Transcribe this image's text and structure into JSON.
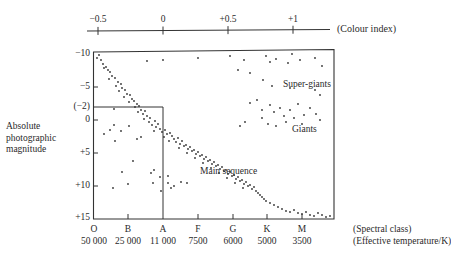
{
  "colour_axis": {
    "label": "(Colour index)",
    "ticks": [
      {
        "label": "−0.5",
        "x": 98
      },
      {
        "label": "0",
        "x": 163
      },
      {
        "label": "+0.5",
        "x": 228
      },
      {
        "label": "+1",
        "x": 293
      }
    ]
  },
  "y_axis": {
    "label_lines": [
      "Absolute",
      "photographic",
      "magnitude"
    ],
    "ticks": [
      {
        "label": "−10",
        "y": 54
      },
      {
        "label": "−5",
        "y": 87
      },
      {
        "label": "(−2)",
        "y": 107
      },
      {
        "label": "0",
        "y": 120
      },
      {
        "label": "+5",
        "y": 153
      },
      {
        "label": "+10",
        "y": 186
      },
      {
        "label": "+15",
        "y": 218
      }
    ]
  },
  "x_axis": {
    "spectral_label": "(Spectral class)",
    "temperature_label": "(Effective temperature/K)",
    "ticks": [
      {
        "class": "O",
        "temp": "50 000",
        "x": 94
      },
      {
        "class": "B",
        "temp": "25 000",
        "x": 128
      },
      {
        "class": "A",
        "temp": "11 000",
        "x": 163
      },
      {
        "class": "F",
        "temp": "7500",
        "x": 198
      },
      {
        "class": "G",
        "temp": "6000",
        "x": 233
      },
      {
        "class": "K",
        "temp": "5000",
        "x": 267
      },
      {
        "class": "M",
        "temp": "3500",
        "x": 302
      }
    ]
  },
  "annotations": {
    "super_giants": "Super-giants",
    "giants": "Giants",
    "main_sequence": "Main sequence"
  },
  "chart_data": {
    "type": "scatter",
    "xlabel": "Spectral class / Effective temperature (K) / Colour index",
    "ylabel": "Absolute photographic magnitude",
    "ylim": [
      -10,
      15
    ],
    "y_inverted": true,
    "x_categories": [
      "O",
      "B",
      "A",
      "F",
      "G",
      "K",
      "M"
    ],
    "x_temperatures": [
      "50 000",
      "25 000",
      "11 000",
      "7500",
      "6000",
      "5000",
      "3500"
    ],
    "colour_index_ticks": [
      -0.5,
      0,
      0.5,
      1
    ],
    "reference_lines": {
      "magnitude": -2,
      "spectral_class": "A"
    },
    "regions": [
      "Super-giants",
      "Giants",
      "Main sequence"
    ],
    "points_px": [
      [
        99,
        55
      ],
      [
        97,
        58
      ],
      [
        101,
        60
      ],
      [
        103,
        64
      ],
      [
        106,
        67
      ],
      [
        108,
        70
      ],
      [
        104,
        68
      ],
      [
        110,
        72
      ],
      [
        112,
        76
      ],
      [
        109,
        79
      ],
      [
        115,
        78
      ],
      [
        118,
        82
      ],
      [
        116,
        86
      ],
      [
        121,
        84
      ],
      [
        122,
        88
      ],
      [
        119,
        91
      ],
      [
        125,
        90
      ],
      [
        127,
        94
      ],
      [
        124,
        97
      ],
      [
        130,
        95
      ],
      [
        132,
        99
      ],
      [
        129,
        102
      ],
      [
        134,
        101
      ],
      [
        137,
        104
      ],
      [
        135,
        107
      ],
      [
        139,
        106
      ],
      [
        141,
        110
      ],
      [
        138,
        112
      ],
      [
        143,
        114
      ],
      [
        145,
        111
      ],
      [
        147,
        116
      ],
      [
        144,
        119
      ],
      [
        150,
        118
      ],
      [
        149,
        122
      ],
      [
        152,
        125
      ],
      [
        155,
        121
      ],
      [
        156,
        127
      ],
      [
        158,
        124
      ],
      [
        160,
        129
      ],
      [
        154,
        131
      ],
      [
        162,
        132
      ],
      [
        165,
        130
      ],
      [
        167,
        134
      ],
      [
        164,
        137
      ],
      [
        170,
        133
      ],
      [
        172,
        136
      ],
      [
        174,
        139
      ],
      [
        169,
        141
      ],
      [
        176,
        142
      ],
      [
        178,
        138
      ],
      [
        180,
        144
      ],
      [
        182,
        141
      ],
      [
        184,
        146
      ],
      [
        179,
        148
      ],
      [
        186,
        145
      ],
      [
        188,
        149
      ],
      [
        190,
        147
      ],
      [
        192,
        151
      ],
      [
        187,
        153
      ],
      [
        194,
        150
      ],
      [
        196,
        154
      ],
      [
        198,
        152
      ],
      [
        200,
        156
      ],
      [
        195,
        158
      ],
      [
        202,
        155
      ],
      [
        204,
        159
      ],
      [
        206,
        157
      ],
      [
        208,
        161
      ],
      [
        203,
        163
      ],
      [
        210,
        160
      ],
      [
        212,
        164
      ],
      [
        214,
        162
      ],
      [
        216,
        166
      ],
      [
        211,
        168
      ],
      [
        218,
        165
      ],
      [
        220,
        169
      ],
      [
        222,
        167
      ],
      [
        224,
        171
      ],
      [
        219,
        173
      ],
      [
        226,
        170
      ],
      [
        228,
        174
      ],
      [
        230,
        172
      ],
      [
        232,
        176
      ],
      [
        227,
        178
      ],
      [
        234,
        175
      ],
      [
        236,
        179
      ],
      [
        238,
        177
      ],
      [
        240,
        181
      ],
      [
        235,
        183
      ],
      [
        242,
        180
      ],
      [
        244,
        184
      ],
      [
        246,
        182
      ],
      [
        248,
        186
      ],
      [
        243,
        188
      ],
      [
        250,
        185
      ],
      [
        252,
        189
      ],
      [
        254,
        187
      ],
      [
        256,
        191
      ],
      [
        258,
        193
      ],
      [
        260,
        195
      ],
      [
        262,
        197
      ],
      [
        264,
        199
      ],
      [
        266,
        201
      ],
      [
        270,
        203
      ],
      [
        274,
        205
      ],
      [
        278,
        207
      ],
      [
        282,
        209
      ],
      [
        286,
        211
      ],
      [
        290,
        212
      ],
      [
        294,
        210
      ],
      [
        298,
        213
      ],
      [
        302,
        214
      ],
      [
        306,
        212
      ],
      [
        310,
        215
      ],
      [
        314,
        216
      ],
      [
        318,
        213
      ],
      [
        322,
        215
      ],
      [
        326,
        217
      ],
      [
        330,
        216
      ],
      [
        147,
        61
      ],
      [
        163,
        60
      ],
      [
        198,
        58
      ],
      [
        230,
        56
      ],
      [
        244,
        60
      ],
      [
        266,
        56
      ],
      [
        270,
        62
      ],
      [
        276,
        59
      ],
      [
        288,
        63
      ],
      [
        292,
        54
      ],
      [
        300,
        60
      ],
      [
        315,
        58
      ],
      [
        322,
        66
      ],
      [
        238,
        70
      ],
      [
        250,
        73
      ],
      [
        263,
        80
      ],
      [
        272,
        86
      ],
      [
        290,
        88
      ],
      [
        315,
        90
      ],
      [
        320,
        95
      ],
      [
        250,
        103
      ],
      [
        257,
        100
      ],
      [
        262,
        110
      ],
      [
        270,
        105
      ],
      [
        274,
        112
      ],
      [
        280,
        108
      ],
      [
        284,
        116
      ],
      [
        290,
        110
      ],
      [
        294,
        118
      ],
      [
        298,
        104
      ],
      [
        304,
        115
      ],
      [
        310,
        108
      ],
      [
        316,
        114
      ],
      [
        320,
        120
      ],
      [
        262,
        118
      ],
      [
        268,
        124
      ],
      [
        276,
        126
      ],
      [
        286,
        122
      ],
      [
        302,
        124
      ],
      [
        245,
        122
      ],
      [
        240,
        126
      ],
      [
        114,
        109
      ],
      [
        104,
        134
      ],
      [
        110,
        130
      ],
      [
        114,
        125
      ],
      [
        121,
        131
      ],
      [
        129,
        126
      ],
      [
        115,
        141
      ],
      [
        137,
        139
      ],
      [
        141,
        137
      ],
      [
        133,
        161
      ],
      [
        151,
        173
      ],
      [
        154,
        170
      ],
      [
        153,
        183
      ],
      [
        160,
        177
      ],
      [
        161,
        191
      ],
      [
        168,
        176
      ],
      [
        168,
        183
      ],
      [
        171,
        188
      ],
      [
        174,
        186
      ],
      [
        181,
        182
      ],
      [
        187,
        183
      ],
      [
        122,
        172
      ],
      [
        113,
        188
      ],
      [
        128,
        184
      ]
    ]
  }
}
